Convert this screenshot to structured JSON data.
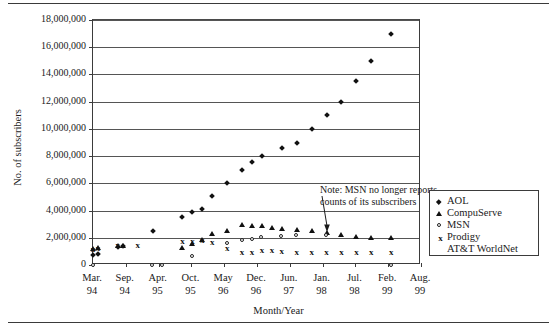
{
  "chart_data": {
    "type": "scatter",
    "title": "",
    "xlabel": "Month/Year",
    "ylabel": "No. of subscribers",
    "ylim": [
      0,
      18000000
    ],
    "ytick_labels": [
      "18,000,000",
      "16,000,000",
      "14,000,000",
      "12,000,000",
      "10,000,000",
      "8,000,000",
      "6,000,000",
      "4,000,000",
      "2,000,000",
      "0"
    ],
    "ytick_values": [
      18000000,
      16000000,
      14000000,
      12000000,
      10000000,
      8000000,
      6000000,
      4000000,
      2000000,
      0
    ],
    "grid": true,
    "legend_position": "right-inside",
    "xtick_labels": [
      {
        "month": "Mar.",
        "year": "94"
      },
      {
        "month": "Sep.",
        "year": "94"
      },
      {
        "month": "Apr.",
        "year": "95"
      },
      {
        "month": "Oct.",
        "year": "95"
      },
      {
        "month": "May",
        "year": "96"
      },
      {
        "month": "Dec.",
        "year": "96"
      },
      {
        "month": "Jun.",
        "year": "97"
      },
      {
        "month": "Jan.",
        "year": "98"
      },
      {
        "month": "Jul.",
        "year": "98"
      },
      {
        "month": "Feb.",
        "year": "99"
      },
      {
        "month": "Aug.",
        "year": "99"
      }
    ],
    "x_range_months": [
      0,
      66
    ],
    "series": [
      {
        "name": "AOL",
        "marker": "diamond",
        "points": [
          {
            "x": 0,
            "y": 700000
          },
          {
            "x": 1,
            "y": 800000
          },
          {
            "x": 5,
            "y": 1300000
          },
          {
            "x": 6,
            "y": 1400000
          },
          {
            "x": 12,
            "y": 2500000
          },
          {
            "x": 18,
            "y": 3500000
          },
          {
            "x": 20,
            "y": 3900000
          },
          {
            "x": 22,
            "y": 4100000
          },
          {
            "x": 24,
            "y": 5100000
          },
          {
            "x": 27,
            "y": 6000000
          },
          {
            "x": 30,
            "y": 7000000
          },
          {
            "x": 32,
            "y": 7600000
          },
          {
            "x": 34,
            "y": 8000000
          },
          {
            "x": 38,
            "y": 8600000
          },
          {
            "x": 41,
            "y": 9000000
          },
          {
            "x": 44,
            "y": 10000000
          },
          {
            "x": 47,
            "y": 11000000
          },
          {
            "x": 50,
            "y": 12000000
          },
          {
            "x": 53,
            "y": 13500000
          },
          {
            "x": 56,
            "y": 15000000
          },
          {
            "x": 60,
            "y": 17000000
          }
        ]
      },
      {
        "name": "CompuServe",
        "marker": "triangle",
        "points": [
          {
            "x": 0,
            "y": 1200000
          },
          {
            "x": 1,
            "y": 1250000
          },
          {
            "x": 5,
            "y": 1400000
          },
          {
            "x": 6,
            "y": 1450000
          },
          {
            "x": 18,
            "y": 1300000
          },
          {
            "x": 20,
            "y": 1600000
          },
          {
            "x": 22,
            "y": 1900000
          },
          {
            "x": 24,
            "y": 2300000
          },
          {
            "x": 27,
            "y": 2550000
          },
          {
            "x": 30,
            "y": 3000000
          },
          {
            "x": 32,
            "y": 2900000
          },
          {
            "x": 34,
            "y": 2900000
          },
          {
            "x": 36,
            "y": 2750000
          },
          {
            "x": 38,
            "y": 2700000
          },
          {
            "x": 41,
            "y": 2600000
          },
          {
            "x": 44,
            "y": 2500000
          },
          {
            "x": 47,
            "y": 2400000
          },
          {
            "x": 50,
            "y": 2250000
          },
          {
            "x": 53,
            "y": 2100000
          },
          {
            "x": 56,
            "y": 2000000
          },
          {
            "x": 60,
            "y": 2050000
          }
        ]
      },
      {
        "name": "MSN",
        "marker": "open-circle",
        "points": [
          {
            "x": 0,
            "y": 0
          },
          {
            "x": 12,
            "y": 0
          },
          {
            "x": 14,
            "y": 0
          },
          {
            "x": 20,
            "y": 600000
          },
          {
            "x": 27,
            "y": 1600000
          },
          {
            "x": 30,
            "y": 1800000
          },
          {
            "x": 32,
            "y": 1900000
          },
          {
            "x": 34,
            "y": 2000000
          },
          {
            "x": 38,
            "y": 2100000
          },
          {
            "x": 41,
            "y": 2150000
          },
          {
            "x": 47,
            "y": 2200000
          },
          {
            "x": 60,
            "y": 0
          }
        ]
      },
      {
        "name": "Prodigy",
        "marker": "x",
        "points": [
          {
            "x": 0,
            "y": 1100000
          },
          {
            "x": 1,
            "y": 1150000
          },
          {
            "x": 5,
            "y": 1400000
          },
          {
            "x": 9,
            "y": 1400000
          },
          {
            "x": 18,
            "y": 1700000
          },
          {
            "x": 20,
            "y": 1700000
          },
          {
            "x": 22,
            "y": 1750000
          },
          {
            "x": 24,
            "y": 1600000
          },
          {
            "x": 27,
            "y": 1200000
          },
          {
            "x": 30,
            "y": 900000
          },
          {
            "x": 32,
            "y": 850000
          },
          {
            "x": 34,
            "y": 1000000
          },
          {
            "x": 36,
            "y": 1000000
          },
          {
            "x": 38,
            "y": 950000
          },
          {
            "x": 41,
            "y": 900000
          },
          {
            "x": 44,
            "y": 900000
          },
          {
            "x": 47,
            "y": 900000
          },
          {
            "x": 50,
            "y": 900000
          },
          {
            "x": 53,
            "y": 900000
          },
          {
            "x": 56,
            "y": 900000
          },
          {
            "x": 60,
            "y": 900000
          }
        ]
      },
      {
        "name": "AT&T WorldNet",
        "marker": "none",
        "points": []
      }
    ],
    "annotations": [
      {
        "name": "msn-note",
        "line1": "Note: MSN no longer reports",
        "line2": "counts of its subscribers",
        "arrow_to_x": 47,
        "arrow_to_y": 2400000
      }
    ]
  },
  "legend": {
    "entries": [
      {
        "label": "AOL",
        "marker": "diamond"
      },
      {
        "label": "CompuServe",
        "marker": "triangle"
      },
      {
        "label": "MSN",
        "marker": "open-circle"
      },
      {
        "label": "Prodigy",
        "marker": "x"
      },
      {
        "label": "AT&T WorldNet",
        "marker": "none"
      }
    ]
  },
  "colors": {
    "ink": "#111111",
    "grid": "#555555",
    "frame": "#3b3b3b",
    "background": "#ffffff"
  }
}
